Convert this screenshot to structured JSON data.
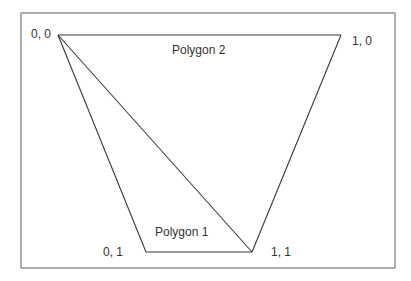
{
  "diagram": {
    "vertices": [
      {
        "id": "v00",
        "label": "0, 0"
      },
      {
        "id": "v10",
        "label": "1, 0"
      },
      {
        "id": "v01",
        "label": "0, 1"
      },
      {
        "id": "v11",
        "label": "1, 1"
      }
    ],
    "polygons": [
      {
        "id": "polygon-1",
        "label": "Polygon 1",
        "vertices": [
          "v00",
          "v11",
          "v01"
        ]
      },
      {
        "id": "polygon-2",
        "label": "Polygon 2",
        "vertices": [
          "v00",
          "v10",
          "v11"
        ]
      }
    ],
    "colors": {
      "stroke": "#3a3a3a",
      "frame": "#7a7a7a",
      "text": "#333333",
      "background": "#ffffff"
    }
  }
}
